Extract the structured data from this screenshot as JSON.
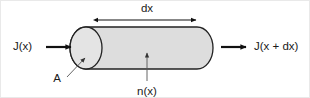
{
  "figure": {
    "background_color": "#ffffff",
    "border_color": "#e9e9e9",
    "cylinder": {
      "fill_color": "#dddddd",
      "face_fill_color": "#e4e4e4",
      "outline_color": "#222222"
    },
    "labels": {
      "flux_in": "J(x)",
      "flux_out": "J(x + dx)",
      "thickness": "dx",
      "area": "A",
      "density": "n(x)"
    },
    "arrows": {
      "flux_in_direction": "right",
      "flux_out_direction": "right",
      "thickness_style": "double-headed",
      "area_leader_style": "thin-pointer",
      "density_leader_style": "thin-pointer-up"
    }
  }
}
